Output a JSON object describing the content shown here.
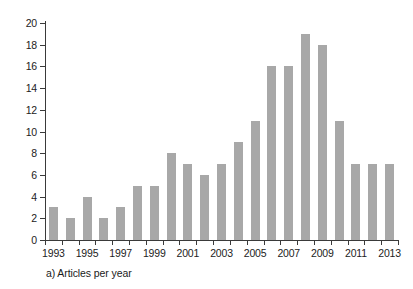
{
  "chart_data": {
    "type": "bar",
    "title": "",
    "caption": "a) Articles per year",
    "xlabel": "",
    "ylabel": "",
    "categories": [
      "1993",
      "1994",
      "1995",
      "1996",
      "1997",
      "1998",
      "1999",
      "2000",
      "2001",
      "2002",
      "2003",
      "2004",
      "2005",
      "2006",
      "2007",
      "2008",
      "2009",
      "2010",
      "2011",
      "2012",
      "2013"
    ],
    "values": [
      3,
      2,
      4,
      2,
      3,
      5,
      5,
      8,
      7,
      6,
      7,
      9,
      11,
      16,
      16,
      19,
      18,
      11,
      7,
      7,
      7
    ],
    "ylim": [
      0,
      20
    ],
    "y_ticks": [
      0,
      2,
      4,
      6,
      8,
      10,
      12,
      14,
      16,
      18,
      20
    ],
    "y_tick_labels": [
      "0",
      "2",
      "4",
      "6",
      "8",
      "10",
      "12",
      "14",
      "16",
      "18",
      "20"
    ],
    "x_tick_labels": [
      "1993",
      "1995",
      "1997",
      "1999",
      "2001",
      "2003",
      "2005",
      "2007",
      "2009",
      "2011",
      "2013"
    ],
    "grid": false,
    "legend": false,
    "bar_color": "#a8a8a8",
    "axis_color": "#3a3a3a",
    "background": "#ffffff"
  }
}
